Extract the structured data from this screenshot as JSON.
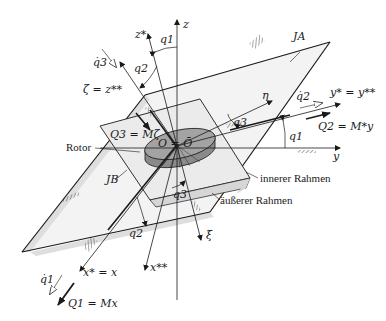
{
  "figure": {
    "labels": {
      "z": "z",
      "z_star": "z*",
      "q1_top": "q1",
      "q2_top": "q2",
      "q3_dot_top": "q̇3",
      "zeta_eq": "ζ = z**",
      "J_A": "JA",
      "eta": "η",
      "q2_dot": "q̇2",
      "y_star_eq": "y* = y**",
      "Q3_eq": "Q3 = Mζ",
      "O_eq": "O = Ō",
      "q3_right": "q3",
      "q1_right": "q1",
      "Q2_eq": "Q2 = M*y",
      "rotor": "Rotor",
      "y": "y",
      "J_B": "JB",
      "inner_frame": "innerer Rahmen",
      "outer_frame": "äußerer Rahmen",
      "q3_bottom": "q3",
      "q2_bottom": "q2",
      "xi": "ξ",
      "x_star_eq": "x* = x",
      "x_dstar": "x**",
      "q1_dot": "q̇1",
      "Q1_eq": "Q1 = Mx"
    },
    "colors": {
      "outer_frame_fill": "#f2f2f2",
      "outer_frame_shade": "#dcdcdc",
      "inner_frame_fill": "#ececec",
      "rotor_fill": "#8f8f8f",
      "rotor_top": "#a6a6a6",
      "line": "#1a1a1a"
    }
  }
}
